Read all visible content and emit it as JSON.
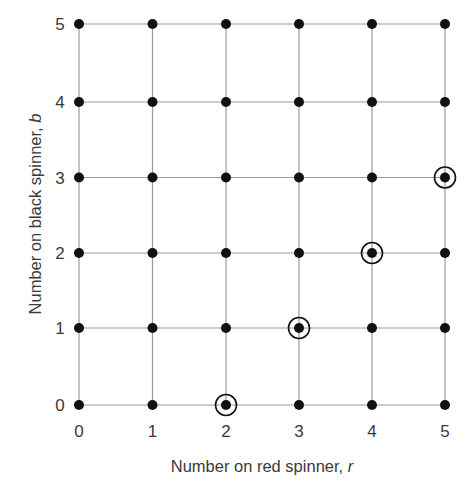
{
  "chart_data": {
    "type": "scatter",
    "title": "",
    "xlabel": "Number on red spinner, r",
    "xlabel_main": "Number on red spinner, ",
    "xlabel_var": "r",
    "ylabel": "Number on black spinner, b",
    "ylabel_main": "Number on black spinner, ",
    "ylabel_var": "b",
    "x_ticks": [
      "0",
      "1",
      "2",
      "3",
      "4",
      "5"
    ],
    "y_ticks": [
      "0",
      "1",
      "2",
      "3",
      "4",
      "5"
    ],
    "xlim": [
      0,
      5
    ],
    "ylim": [
      0,
      5
    ],
    "grid": true,
    "legend": "none",
    "points": "all integer pairs (r, b) with 0 <= r <= 5 and 0 <= b <= 5",
    "point_count": 36,
    "highlighted_points": [
      {
        "r": 2,
        "b": 0
      },
      {
        "r": 3,
        "b": 1
      },
      {
        "r": 4,
        "b": 2
      },
      {
        "r": 5,
        "b": 3
      }
    ],
    "highlight_rule": "r - b = 2 (circled)"
  },
  "style": {
    "grid_color": "#9a9a9a",
    "dot_color": "#111111",
    "ring_color": "#111111",
    "text_color": "#3a3a3a"
  }
}
